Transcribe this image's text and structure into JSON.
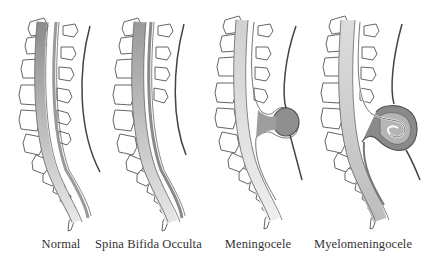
{
  "diagram": {
    "panels": [
      {
        "id": "normal",
        "label": "Normal",
        "has_sac": false,
        "sac_contains_cord": false
      },
      {
        "id": "spina-bifida-occulta",
        "label": "Spina Bifida Occulta",
        "has_sac": false,
        "sac_contains_cord": false
      },
      {
        "id": "meningocele",
        "label": "Meningocele",
        "has_sac": true,
        "sac_contains_cord": false
      },
      {
        "id": "myelomeningocele",
        "label": "Myelomeningocele",
        "has_sac": true,
        "sac_contains_cord": true
      }
    ],
    "colors": {
      "outline": "#555555",
      "vertebra_fill": "#ffffff",
      "cord_dark": "#9a9a9a",
      "cord_light": "#e6e6e6",
      "sac_fill": "#8f8f8f",
      "skin_line": "#444444",
      "label_text": "#333333"
    }
  }
}
